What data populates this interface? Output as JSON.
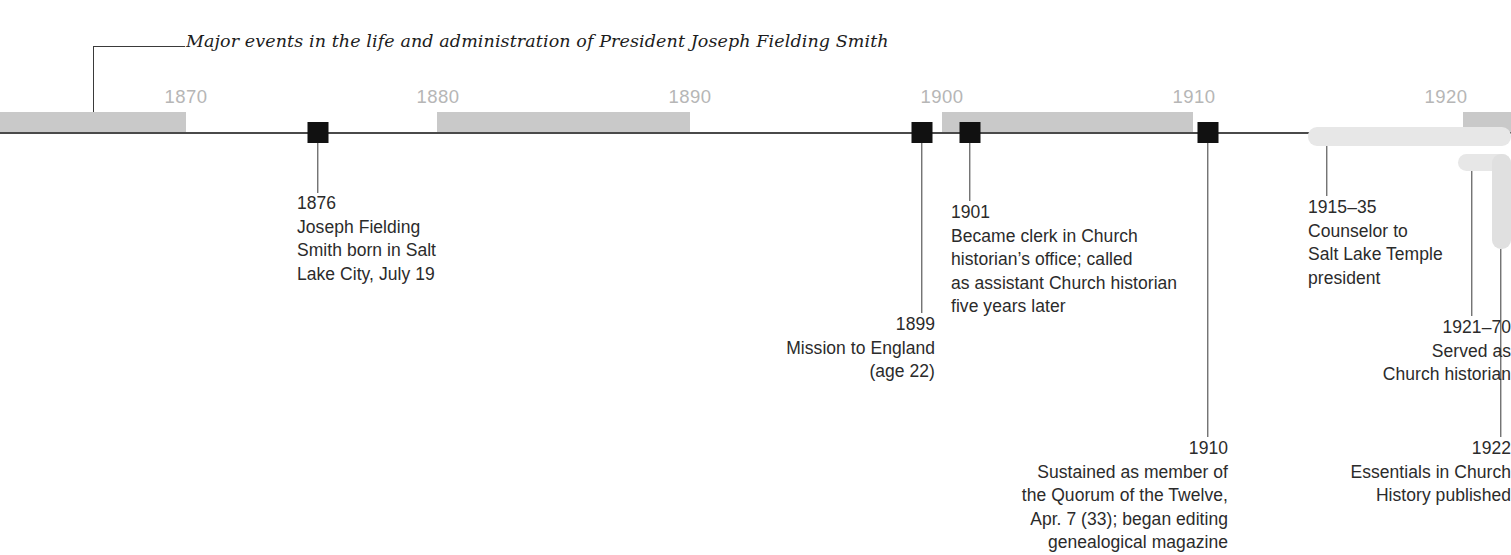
{
  "figure": {
    "title": "Major events in the life and administration of President Joseph Fielding Smith",
    "axis": {
      "year_labels": [
        "1870",
        "1880",
        "1890",
        "1900",
        "1910",
        "1920"
      ],
      "range_start": 1865,
      "range_end": 1924,
      "colors": {
        "band_gray": "#c9c9c9",
        "band_white": "#ffffff",
        "axis_line": "#4a4a4a",
        "tick_text": "#b6b6b6",
        "marker": "#111111",
        "span_bar": "#e7e7e7",
        "text": "#2b2b2b"
      }
    }
  },
  "events": [
    {
      "id": "event-1876",
      "year_label": "1876",
      "description": "Joseph Fielding\nSmith born in Salt\nLake City, July 19",
      "align": "left",
      "marker": "square"
    },
    {
      "id": "event-1899",
      "year_label": "1899",
      "description": "Mission to England\n(age 22)",
      "align": "right",
      "marker": "square"
    },
    {
      "id": "event-1901",
      "year_label": "1901",
      "description": "Became clerk in Church\nhistorian’s office; called\nas assistant Church historian\nfive years later",
      "align": "left",
      "marker": "square"
    },
    {
      "id": "event-1910",
      "year_label": "1910",
      "description": "Sustained as member of\nthe Quorum of the Twelve,\nApr. 7 (33); began editing\ngenealogical magazine",
      "align": "right",
      "marker": "square"
    },
    {
      "id": "event-1915-35",
      "year_label": "1915–35",
      "description": "Counselor to\nSalt Lake Temple\npresident",
      "align": "left",
      "marker": "span-bar"
    },
    {
      "id": "event-1921-70",
      "year_label": "1921–70",
      "description": "Served as\nChurch historian",
      "align": "right",
      "marker": "span-bar"
    },
    {
      "id": "event-1922",
      "year_label": "1922",
      "description_italic": "Essentials in Church\nHistory",
      "description_tail": " published",
      "align": "right",
      "marker": "span-bar-end"
    }
  ]
}
